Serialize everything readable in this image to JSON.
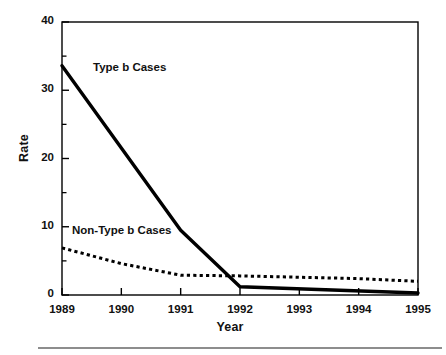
{
  "figure": {
    "footer_rule_color": "#8d8d8d"
  },
  "chart_data": {
    "type": "line",
    "title": "",
    "xlabel": "Year",
    "ylabel": "Rate",
    "categories": [
      "1989",
      "1990",
      "1991",
      "1992",
      "1993",
      "1994",
      "1995"
    ],
    "x": [
      1989,
      1990,
      1991,
      1992,
      1993,
      1994,
      1995
    ],
    "xlim": [
      1989,
      1995
    ],
    "ylim": [
      0,
      40
    ],
    "y_major_ticks": [
      0,
      10,
      20,
      30,
      40
    ],
    "y_major_tick_labels": [
      "0",
      "10",
      "20",
      "30",
      "40"
    ],
    "y_minor_ticks": [
      5,
      15,
      25,
      35
    ],
    "x_tick_labels": [
      "1989",
      "1990",
      "1991",
      "1992",
      "1993",
      "1994",
      "1995"
    ],
    "grid": false,
    "legend_position": "inline-annotations",
    "series": [
      {
        "name": "Type b Cases",
        "style": "solid",
        "color": "#000000",
        "line_width": 3.4,
        "x": [
          1989,
          1991,
          1992,
          1995
        ],
        "values": [
          33.6,
          9.5,
          1.2,
          0.3
        ],
        "annotation": "Type b Cases"
      },
      {
        "name": "Non-Type b Cases",
        "style": "dotted",
        "color": "#000000",
        "line_width": 3.0,
        "x": [
          1989,
          1990,
          1991,
          1992,
          1993,
          1994,
          1995
        ],
        "values": [
          6.9,
          4.6,
          2.9,
          2.8,
          2.6,
          2.4,
          2.0
        ],
        "annotation": "Non-Type b Cases"
      }
    ],
    "annotations": [
      {
        "text": "Type b Cases",
        "x_px": 93,
        "y_px": 61
      },
      {
        "text": "Non-Type b Cases",
        "x_px": 72,
        "y_px": 224
      }
    ]
  }
}
